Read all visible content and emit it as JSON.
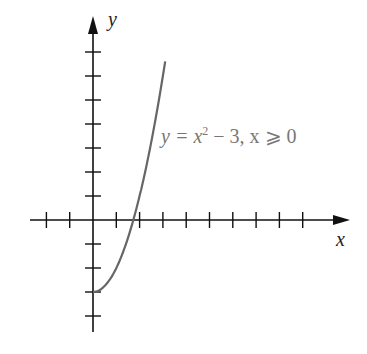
{
  "chart_data": {
    "type": "line",
    "title": "",
    "xlabel": "x",
    "ylabel": "y",
    "annotation": "y = x² − 3, x ⩾ 0",
    "xlim": [
      -2.7,
      11.2
    ],
    "ylim": [
      -4.7,
      7.8
    ],
    "x_ticks": [
      -2,
      -1,
      1,
      2,
      3,
      4,
      5,
      6,
      7,
      8,
      9
    ],
    "y_ticks": [
      -4,
      -3,
      -2,
      -1,
      1,
      2,
      3,
      4,
      5,
      6,
      7
    ],
    "grid": false,
    "tick_labels_shown": false,
    "series": [
      {
        "name": "y = x^2 - 3, x >= 0",
        "x": [
          0,
          0.5,
          1,
          1.5,
          1.732,
          2,
          2.5,
          3,
          3.1
        ],
        "y": [
          -3,
          -2.75,
          -2,
          -0.75,
          0,
          1,
          3.25,
          6,
          6.61
        ]
      }
    ],
    "colors": {
      "axes": "#111111",
      "curve": "#666666",
      "annotation": "#777777"
    }
  },
  "labels": {
    "x_axis": "x",
    "y_axis": "y",
    "equation_lhs": "y",
    "equation_rest": " = x",
    "sup": "2",
    "equation_tail": " − 3, x ⩾ 0"
  }
}
